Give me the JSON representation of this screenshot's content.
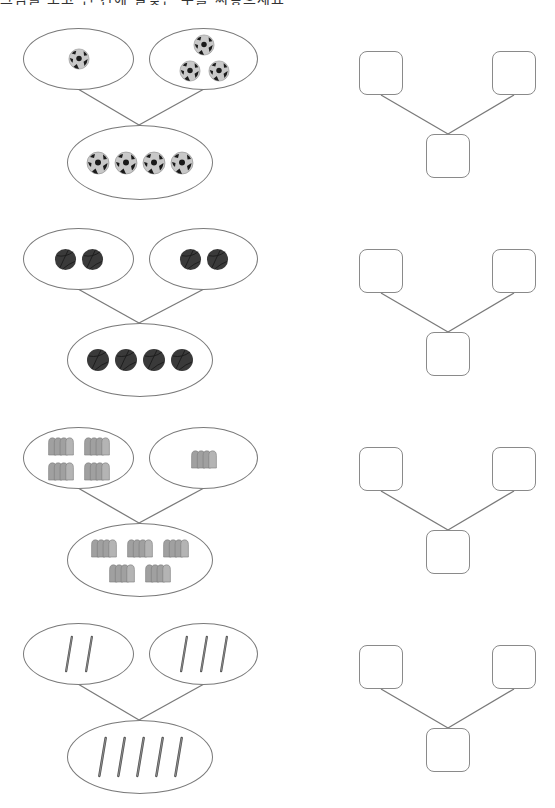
{
  "header": {
    "instruction_text": "그림을 보고 빈 칸에 알맞은 수를 써넣으세요"
  },
  "colors": {
    "line": "#7a7a7a",
    "soccer_light": "#c8c8c8",
    "soccer_dark": "#1a1a1a",
    "basketball": "#3a3a3a",
    "bread": "#9a9a9a",
    "pencil": "#555555"
  },
  "problems": [
    {
      "object": "soccer-ball",
      "left_count": 1,
      "right_count": 3,
      "total_count": 4,
      "answer_boxes": {
        "left": "",
        "right": "",
        "total": ""
      }
    },
    {
      "object": "basketball",
      "left_count": 2,
      "right_count": 2,
      "total_count": 4,
      "answer_boxes": {
        "left": "",
        "right": "",
        "total": ""
      }
    },
    {
      "object": "bread-loaf",
      "left_count": 4,
      "right_count": 1,
      "total_count": 5,
      "answer_boxes": {
        "left": "",
        "right": "",
        "total": ""
      }
    },
    {
      "object": "pencil",
      "left_count": 2,
      "right_count": 3,
      "total_count": 5,
      "answer_boxes": {
        "left": "",
        "right": "",
        "total": ""
      }
    }
  ]
}
